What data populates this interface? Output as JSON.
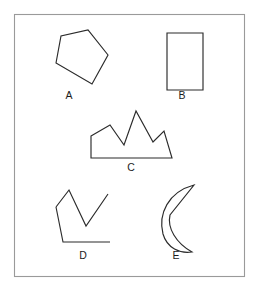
{
  "figure": {
    "background_color": "#ffffff",
    "panel": {
      "name": "outer-border",
      "x": 14.5,
      "y": 14.5,
      "width": 230,
      "height": 262,
      "stroke": "#9a9a9a",
      "fill": "#ffffff"
    },
    "stroke_color": "#2b2b2b",
    "label_color": "#1c1c1c",
    "shapes": [
      {
        "id": "A",
        "label": "A",
        "kind": "pentagon",
        "closed": true,
        "points": "56,63 61,36 88,30 108,55 92,84",
        "label_x": 69,
        "label_y": 99
      },
      {
        "id": "B",
        "label": "B",
        "kind": "rectangle",
        "closed": true,
        "points": "167,33 203,33 203,90 167,90",
        "label_x": 182,
        "label_y": 99
      },
      {
        "id": "C",
        "label": "C",
        "kind": "crown",
        "closed": true,
        "points": "91,136 110,125 124,145 136,111 153,142 164,131 172,158 91,158",
        "label_x": 131,
        "label_y": 171
      },
      {
        "id": "D",
        "label": "D",
        "kind": "open-polyline",
        "closed": false,
        "points": "56,207 69,190 86,226 108,194 108,194",
        "points_tail": "56,207 63,242 110,242",
        "label_x": 83,
        "label_y": 259
      },
      {
        "id": "E",
        "label": "E",
        "kind": "crescent",
        "closed": true,
        "path": "M 194,185 C 168,192 158,214 163,234 C 167,248 180,254 192,252 C 176,243 167,228 170,215 Z",
        "label_x": 176,
        "label_y": 259
      }
    ]
  }
}
